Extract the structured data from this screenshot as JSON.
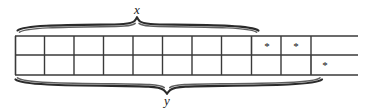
{
  "figure": {
    "width": 369,
    "height": 111,
    "stroke_color": "#2b2b2b",
    "background_color": "#ffffff"
  },
  "braces": {
    "top": {
      "label": "x",
      "position": "above",
      "x_start": 17,
      "x_end": 259,
      "label_x": 137,
      "spans_cells": 8
    },
    "bottom": {
      "label": "y",
      "position": "below",
      "x_start": 15,
      "x_end": 322,
      "label_x": 167,
      "spans_cells": 10
    }
  },
  "grid": {
    "left": 15,
    "right": 358,
    "line_y": [
      36,
      55,
      75
    ],
    "cell_width": 29.5,
    "rows": [
      {
        "name": "top-row",
        "dividers": [
          15,
          44.5,
          74,
          103.5,
          133,
          162.5,
          192,
          221.5,
          251,
          281,
          311
        ],
        "cells": [
          {
            "index": 0,
            "mark": ""
          },
          {
            "index": 1,
            "mark": ""
          },
          {
            "index": 2,
            "mark": ""
          },
          {
            "index": 3,
            "mark": ""
          },
          {
            "index": 4,
            "mark": ""
          },
          {
            "index": 5,
            "mark": ""
          },
          {
            "index": 6,
            "mark": ""
          },
          {
            "index": 7,
            "mark": ""
          },
          {
            "index": 8,
            "mark": "*"
          },
          {
            "index": 9,
            "mark": "*"
          }
        ],
        "marks": [
          {
            "symbol": "*",
            "x": 267,
            "y": 46
          },
          {
            "symbol": "*",
            "x": 296,
            "y": 46
          }
        ]
      },
      {
        "name": "bottom-row",
        "dividers": [
          15,
          44.5,
          74,
          103.5,
          133,
          162.5,
          192,
          221.5,
          251,
          281,
          311
        ],
        "cells": [
          {
            "index": 0,
            "mark": ""
          },
          {
            "index": 1,
            "mark": ""
          },
          {
            "index": 2,
            "mark": ""
          },
          {
            "index": 3,
            "mark": ""
          },
          {
            "index": 4,
            "mark": ""
          },
          {
            "index": 5,
            "mark": ""
          },
          {
            "index": 6,
            "mark": ""
          },
          {
            "index": 7,
            "mark": ""
          },
          {
            "index": 8,
            "mark": ""
          },
          {
            "index": 9,
            "mark": ""
          },
          {
            "index": 10,
            "mark": "*"
          }
        ],
        "marks": [
          {
            "symbol": "*",
            "x": 325,
            "y": 65
          }
        ]
      }
    ]
  }
}
